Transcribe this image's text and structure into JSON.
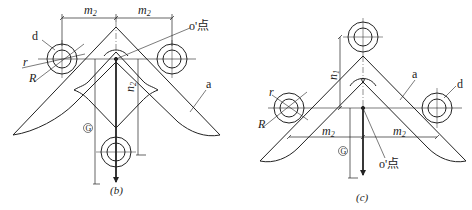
{
  "figure": {
    "background": "#ffffff",
    "stroke_color": "#222222",
    "panels": [
      {
        "id": "b",
        "caption": "(b)",
        "labels": {
          "d": "d",
          "r": "r",
          "R": "R",
          "a": "a",
          "o_point": "o'点",
          "m2_left": "m",
          "m2_left_sub": "2",
          "m2_right": "m",
          "m2_right_sub": "2",
          "n2": "n",
          "n2_sub": "2",
          "circled": "G"
        }
      },
      {
        "id": "c",
        "caption": "(c)",
        "labels": {
          "d": "d",
          "r": "r",
          "R": "R",
          "a": "a",
          "o_point": "o'点",
          "m2_left": "m",
          "m2_left_sub": "2",
          "m2_right": "m",
          "m2_right_sub": "2",
          "n1": "n",
          "n1_sub": "1",
          "circled": "G"
        }
      }
    ]
  }
}
